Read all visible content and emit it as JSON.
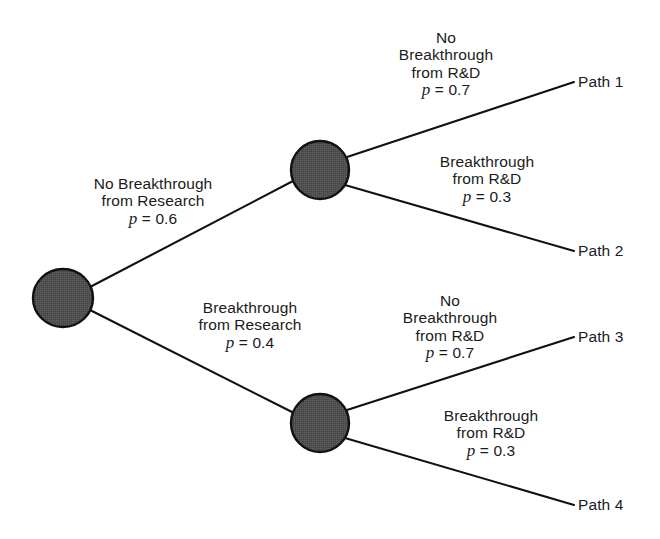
{
  "figure": {
    "type": "decision-tree",
    "background_color": "#ffffff",
    "line_color": "#111111",
    "node_fill_color": "#4f4f4f",
    "node_stroke_color": "#111111",
    "text_color": "#1b1b1b"
  },
  "nodes": [
    {
      "id": "root",
      "kind": "chance-node",
      "cx": 63,
      "cy": 298,
      "rx": 30,
      "ry": 29
    },
    {
      "id": "upper",
      "kind": "chance-node",
      "cx": 320,
      "cy": 170,
      "rx": 29,
      "ry": 29
    },
    {
      "id": "lower",
      "kind": "chance-node",
      "cx": 320,
      "cy": 423,
      "rx": 29,
      "ry": 29
    }
  ],
  "branches": [
    {
      "id": "root-upper",
      "from": "root",
      "to": "upper",
      "x1": 90,
      "y1": 287,
      "x2": 293,
      "y2": 181,
      "label": {
        "lines": [
          "No Breakthrough",
          "from Research"
        ],
        "probability": "0.6",
        "prob_symbol": "p",
        "prob_equals": "=",
        "prob_text": "p = 0.6",
        "center_x": 153,
        "top_y": 175
      }
    },
    {
      "id": "root-lower",
      "from": "root",
      "to": "lower",
      "x1": 90,
      "y1": 310,
      "x2": 292,
      "y2": 412,
      "label": {
        "lines": [
          "Breakthrough",
          "from Research"
        ],
        "probability": "0.4",
        "prob_symbol": "p",
        "prob_equals": "=",
        "prob_text": "p = 0.4",
        "center_x": 250,
        "top_y": 299
      }
    },
    {
      "id": "upper-path1",
      "from": "upper",
      "to": "path1",
      "x1": 347,
      "y1": 157,
      "x2": 574,
      "y2": 82,
      "label": {
        "lines": [
          "No",
          "Breakthrough",
          "from R&D"
        ],
        "probability": "0.7",
        "prob_symbol": "p",
        "prob_equals": "=",
        "prob_text": "p = 0.7",
        "center_x": 446,
        "top_y": 29
      }
    },
    {
      "id": "upper-path2",
      "from": "upper",
      "to": "path2",
      "x1": 345,
      "y1": 185,
      "x2": 574,
      "y2": 251,
      "label": {
        "lines": [
          "Breakthrough",
          "from R&D"
        ],
        "probability": "0.3",
        "prob_symbol": "p",
        "prob_equals": "=",
        "prob_text": "p = 0.3",
        "center_x": 487,
        "top_y": 153
      }
    },
    {
      "id": "lower-path3",
      "from": "lower",
      "to": "path3",
      "x1": 347,
      "y1": 410,
      "x2": 574,
      "y2": 337,
      "label": {
        "lines": [
          "No",
          "Breakthrough",
          "from R&D"
        ],
        "probability": "0.7",
        "prob_symbol": "p",
        "prob_equals": "=",
        "prob_text": "p = 0.7",
        "center_x": 450,
        "top_y": 292
      }
    },
    {
      "id": "lower-path4",
      "from": "lower",
      "to": "path4",
      "x1": 345,
      "y1": 438,
      "x2": 574,
      "y2": 505,
      "label": {
        "lines": [
          "Breakthrough",
          "from R&D"
        ],
        "probability": "0.3",
        "prob_symbol": "p",
        "prob_equals": "=",
        "prob_text": "p = 0.3",
        "center_x": 491,
        "top_y": 407
      }
    }
  ],
  "endpoints": [
    {
      "id": "path1",
      "label": "Path 1",
      "x": 578,
      "y": 73
    },
    {
      "id": "path2",
      "label": "Path 2",
      "x": 578,
      "y": 242
    },
    {
      "id": "path3",
      "label": "Path 3",
      "x": 578,
      "y": 328
    },
    {
      "id": "path4",
      "label": "Path 4",
      "x": 578,
      "y": 496
    }
  ]
}
